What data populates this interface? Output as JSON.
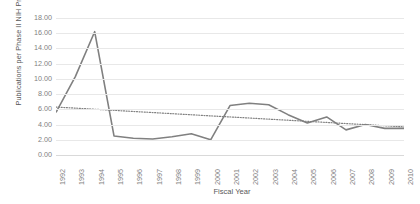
{
  "chart_data": {
    "type": "line",
    "title": "",
    "xlabel": "Fiscal Year",
    "ylabel": "Publications per Phase II NIH Project",
    "categories": [
      "1992",
      "1993",
      "1994",
      "1995",
      "1996",
      "1997",
      "1998",
      "1999",
      "2000",
      "2001",
      "2002",
      "2003",
      "2004",
      "2005",
      "2006",
      "2007",
      "2008",
      "2009",
      "2010"
    ],
    "ylim": [
      0,
      18
    ],
    "ytick_labels": [
      "18.00",
      "16.00",
      "14.00",
      "12.00",
      "10.00",
      "8.00",
      "6.00",
      "4.00",
      "2.00",
      "0.00"
    ],
    "ytick_values": [
      18,
      16,
      14,
      12,
      10,
      8,
      6,
      4,
      2,
      0
    ],
    "grid": true,
    "legend": "none",
    "series": [
      {
        "name": "Publications per Phase II NIH Project",
        "style": "solid",
        "color": "#808080",
        "values": [
          5.6,
          10.3,
          16.2,
          2.5,
          2.2,
          2.1,
          2.4,
          2.8,
          2.0,
          6.5,
          6.8,
          6.6,
          5.3,
          4.2,
          5.0,
          3.3,
          4.0,
          3.5,
          3.5
        ]
      },
      {
        "name": "Linear trendline",
        "style": "dotted",
        "color": "#808080",
        "values": [
          6.3,
          6.16,
          6.01,
          5.87,
          5.72,
          5.58,
          5.43,
          5.29,
          5.14,
          5.0,
          4.86,
          4.71,
          4.57,
          4.42,
          4.28,
          4.13,
          3.99,
          3.84,
          3.7
        ]
      }
    ]
  },
  "colors": {
    "series": "#808080",
    "gridline": "#e8e8e8",
    "tick_text": "#7f7f7f",
    "axis_title_text": "#595959"
  }
}
